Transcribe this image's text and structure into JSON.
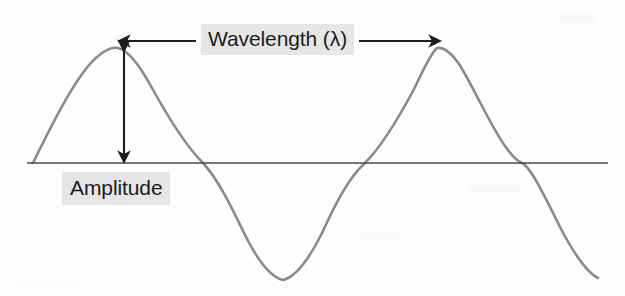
{
  "figure": {
    "background_color": "#fdfdfd",
    "wave_color": "#8a8a8a",
    "axis_color": "#4a4a4a",
    "annotation_color": "#1c1c1c",
    "highlight_color": "#e6e6e6"
  },
  "labels": {
    "wavelength": "Wavelength (λ)",
    "amplitude": "Amplitude"
  },
  "chart_data": {
    "type": "line",
    "xlabel": "",
    "ylabel": "",
    "grid": false,
    "legend": "none",
    "series": [
      {
        "name": "sine-wave",
        "color": "#8a8a8a",
        "description": "Two-crest sinusoid drawn over a horizontal baseline",
        "points_px": [
          {
            "x": 33,
            "y": 163,
            "role": "start-on-baseline"
          },
          {
            "x": 118,
            "y": 48,
            "role": "crest-1"
          },
          {
            "x": 203,
            "y": 163,
            "role": "zero-crossing-descending"
          },
          {
            "x": 283,
            "y": 280,
            "role": "trough-1"
          },
          {
            "x": 365,
            "y": 163,
            "role": "zero-crossing-ascending"
          },
          {
            "x": 437,
            "y": 48,
            "role": "crest-2"
          },
          {
            "x": 522,
            "y": 163,
            "role": "zero-crossing-descending"
          },
          {
            "x": 598,
            "y": 278,
            "role": "end-near-trough"
          }
        ]
      }
    ],
    "baseline": {
      "name": "equilibrium-axis",
      "y_px": 163,
      "x_start_px": 27,
      "x_end_px": 608,
      "color": "#4a4a4a"
    },
    "annotations": [
      {
        "name": "wavelength-measure",
        "text": "Wavelength (λ)",
        "type": "double-headed-horizontal-arrow",
        "y_px": 41,
        "x_start_px": 115,
        "x_end_px": 443,
        "span_px": 328,
        "meaning": "distance from crest 1 to crest 2"
      },
      {
        "name": "amplitude-measure",
        "text": "Amplitude",
        "type": "double-headed-vertical-arrow",
        "x_px": 124,
        "y_start_px": 50,
        "y_end_px": 162,
        "span_px": 112,
        "meaning": "height from equilibrium axis to crest"
      }
    ]
  }
}
